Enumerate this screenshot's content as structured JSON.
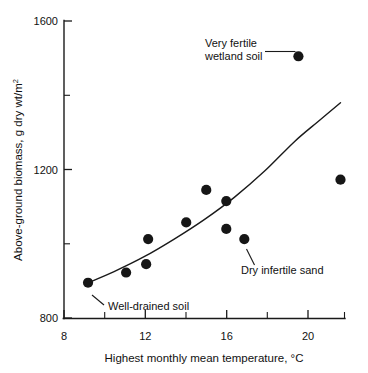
{
  "chart_data": {
    "type": "scatter",
    "title": "",
    "subtitle": "",
    "xlabel": "Highest monthly mean temperature, °C",
    "ylabel": "Above-ground biomass, g dry wt/m2",
    "ylabel_base": "Above-ground biomass, g dry wt/m",
    "ylabel_superscript": "2",
    "xlim": [
      8,
      22
    ],
    "ylim": [
      0,
      1600
    ],
    "grid": false,
    "legend": null,
    "x_major_ticks": [
      8,
      12,
      16,
      20
    ],
    "x_minor_ticks": [
      10,
      14,
      18,
      22
    ],
    "x_tick_labels": [
      "8",
      "12",
      "16",
      "20"
    ],
    "y_major_ticks": [
      0,
      400,
      800,
      1200,
      1600
    ],
    "y_minor_ticks": [
      200,
      600,
      1000,
      1400
    ],
    "y_tick_labels": [
      "0",
      "400",
      "800",
      "1200",
      "1600"
    ],
    "marker_style": "filled-circle",
    "marker_color": "#161616",
    "points": [
      {
        "x": 9.2,
        "y": 190,
        "label": "Well-drained soil"
      },
      {
        "x": 11.1,
        "y": 245,
        "label": ""
      },
      {
        "x": 12.1,
        "y": 290,
        "label": ""
      },
      {
        "x": 12.2,
        "y": 425,
        "label": ""
      },
      {
        "x": 14.1,
        "y": 515,
        "label": ""
      },
      {
        "x": 15.1,
        "y": 690,
        "label": ""
      },
      {
        "x": 16.1,
        "y": 630,
        "label": ""
      },
      {
        "x": 16.1,
        "y": 480,
        "label": ""
      },
      {
        "x": 17.0,
        "y": 425,
        "label": "Dry infertile sand"
      },
      {
        "x": 19.7,
        "y": 1410,
        "label": "Very fertile wetland soil"
      },
      {
        "x": 21.8,
        "y": 745,
        "label": ""
      }
    ],
    "fit_curve": {
      "name": "fitted trend",
      "style": "solid",
      "color": "#1a1a1a",
      "x": [
        9.2,
        10.5,
        12.0,
        13.5,
        15.0,
        16.5,
        18.0,
        19.5,
        20.7,
        21.8
      ],
      "y": [
        190,
        250,
        330,
        425,
        530,
        650,
        790,
        950,
        1060,
        1160
      ]
    },
    "annotations": [
      {
        "id": "very-fertile-wetland-soil",
        "line1": "Very fertile",
        "line2": "wetland soil",
        "text": "Very fertile wetland soil",
        "points_to": {
          "x": 19.7,
          "y": 1410
        }
      },
      {
        "id": "dry-infertile-sand",
        "line1": "Dry infertile sand",
        "line2": "",
        "text": "Dry infertile sand",
        "points_to": {
          "x": 17.0,
          "y": 425
        }
      },
      {
        "id": "well-drained-soil",
        "line1": "Well-drained soil",
        "line2": "",
        "text": "Well-drained soil",
        "points_to": {
          "x": 9.2,
          "y": 190
        }
      }
    ]
  }
}
